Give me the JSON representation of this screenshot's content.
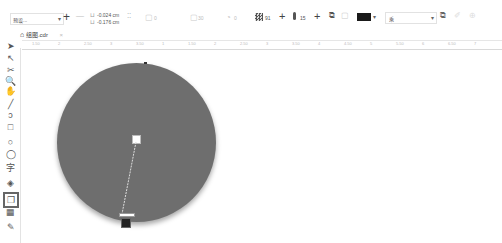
{
  "property_bar": {
    "preset_dropdown": "预设...",
    "add_preset": "+",
    "remove_preset": "—",
    "offset_x": "-0.024 cm",
    "offset_y": "-0.176 cm",
    "field_1_value": "0",
    "field_2_value": "30",
    "field_3_value": "0",
    "opacity_value": "91",
    "feather_value": "15",
    "shadow_color": "#1a1a1a",
    "merge_mode": "乘"
  },
  "document_tab": {
    "label": "组图.cdr",
    "close": "×"
  },
  "ruler": {
    "labels": [
      "1.50",
      "2",
      "2.50",
      "3",
      "3.50",
      "1",
      "1.50",
      "2",
      "2.50",
      "3",
      "3.50",
      "4",
      "4.50",
      "5",
      "5.50",
      "6",
      "6.50",
      "7"
    ]
  },
  "toolbox": {
    "tools": [
      {
        "name": "pick-tool",
        "glyph": "➤"
      },
      {
        "name": "shape-tool",
        "glyph": "↖"
      },
      {
        "name": "crop-tool",
        "glyph": "✂"
      },
      {
        "name": "zoom-tool",
        "glyph": "🔍"
      },
      {
        "name": "pan-tool",
        "glyph": "✋"
      },
      {
        "name": "freehand-tool",
        "glyph": "╱"
      },
      {
        "name": "artistic-media-tool",
        "glyph": "ↄ"
      },
      {
        "name": "rectangle-tool",
        "glyph": "□"
      },
      {
        "name": "ellipse-tool",
        "glyph": "○"
      },
      {
        "name": "polygon-tool",
        "glyph": "◯"
      },
      {
        "name": "text-tool",
        "glyph": "字"
      },
      {
        "name": "interactive-fill-tool",
        "glyph": "◈"
      },
      {
        "name": "drop-shadow-tool",
        "glyph": "❐"
      },
      {
        "name": "transparency-tool",
        "glyph": "▦"
      },
      {
        "name": "eyedropper-tool",
        "glyph": "✎"
      }
    ]
  },
  "canvas": {
    "object_fill": "#6e6e6e"
  }
}
